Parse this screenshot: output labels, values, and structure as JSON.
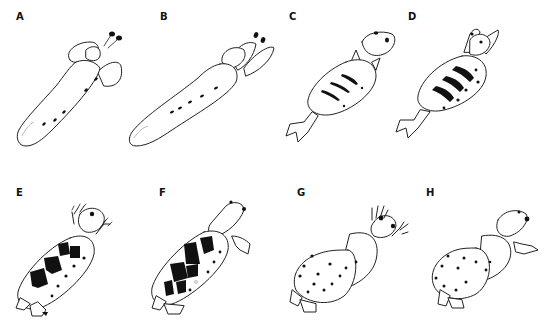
{
  "figure": {
    "panels": [
      {
        "label": "A",
        "description": "elongate body with lateral fins and two stalked eyes, row of dots"
      },
      {
        "label": "B",
        "description": "elongate body with lateral fins and two stalked eyes, row of dots"
      },
      {
        "label": "C",
        "description": "oval body with three thin dark bands, head with eyes, forked tail"
      },
      {
        "label": "D",
        "description": "oval body with three thick dark bands, head with eyes and limbs, forked tail"
      },
      {
        "label": "E",
        "description": "rounded body with large dark patches and dots, clawed forelimbs"
      },
      {
        "label": "F",
        "description": "rounded body with large dark patches and dots, elongated head"
      },
      {
        "label": "G",
        "description": "swollen body with scattered dots, outstretched hands"
      },
      {
        "label": "H",
        "description": "swollen body with scattered dots, elongated head"
      }
    ],
    "colors": {
      "background": "#ffffff",
      "ink": "#222222"
    }
  }
}
